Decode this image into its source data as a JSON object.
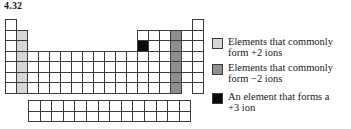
{
  "title": "4.32",
  "table": {
    "cell_w": 11,
    "cell_h": 10.5,
    "origin_x": 5,
    "origin_y": 19,
    "fblock_origin_x": 28,
    "fblock_origin_y": 100,
    "fblock_cell_w": 11.6,
    "colors": {
      "empty": "#ffffff",
      "light": "#d6d6d6",
      "mid": "#8f8f8f",
      "black": "#0a0a0a",
      "border": "#3a3a3a"
    },
    "highlights": {
      "plus2_group": 2,
      "minus2_group": 16,
      "plus3_element": {
        "group": 13,
        "period": 3
      }
    }
  },
  "legend": [
    {
      "swatch": "light",
      "color": "#d6d6d6",
      "line1": "Elements that commonly",
      "line2": "form +2 ions"
    },
    {
      "swatch": "mid",
      "color": "#8f8f8f",
      "line1": "Elements that commonly",
      "line2": "form −2 ions"
    },
    {
      "swatch": "black",
      "color": "#0a0a0a",
      "line1": "An element that forms a",
      "line2": "+3 ion"
    }
  ]
}
